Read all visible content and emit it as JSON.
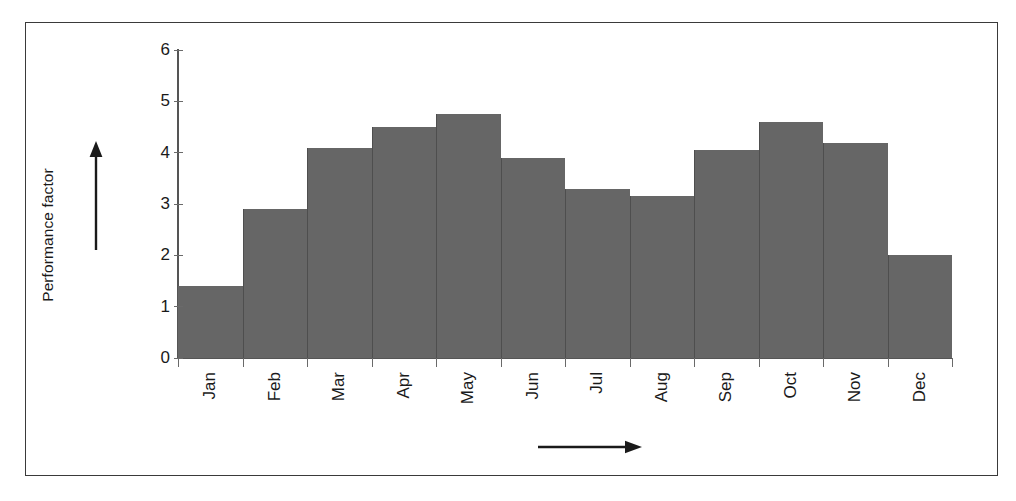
{
  "chart_data": {
    "type": "bar",
    "title": "",
    "subtitle": "",
    "xlabel": "",
    "ylabel": "Performance factor",
    "categories": [
      "Jan",
      "Feb",
      "Mar",
      "Apr",
      "May",
      "Jun",
      "Jul",
      "Aug",
      "Sep",
      "Oct",
      "Nov",
      "Dec"
    ],
    "values": [
      1.4,
      2.9,
      4.1,
      4.5,
      4.75,
      3.9,
      3.3,
      3.15,
      4.05,
      4.6,
      4.18,
      2.0
    ],
    "series": [
      {
        "name": "Performance factor",
        "values": [
          1.4,
          2.9,
          4.1,
          4.5,
          4.75,
          3.9,
          3.3,
          3.15,
          4.05,
          4.6,
          4.18,
          2.0
        ]
      }
    ],
    "ylim": [
      0,
      6
    ],
    "yticks": [
      0,
      1,
      2,
      3,
      4,
      5,
      6
    ],
    "ytick_labels": [
      "0",
      "1",
      "2",
      "3",
      "4",
      "5",
      "6"
    ],
    "grid": false,
    "legend": false,
    "legend_position": "none",
    "bar_color": "#666666",
    "bar_edge_color": "#4e4e4e",
    "axis_color": "#555555",
    "frame_color": "#3a3a3a",
    "background_color": "#ffffff",
    "annotations": [
      {
        "name": "y-axis-direction-arrow",
        "kind": "arrow",
        "direction": "up",
        "text": ""
      },
      {
        "name": "x-axis-direction-arrow",
        "kind": "arrow",
        "direction": "right",
        "text": ""
      }
    ]
  },
  "axes": {
    "y_title": "Performance factor",
    "tick_labels": {
      "y": [
        "6",
        "5",
        "4",
        "3",
        "2",
        "1",
        "0"
      ],
      "x": [
        "Jan",
        "Feb",
        "Mar",
        "Apr",
        "May",
        "Jun",
        "Jul",
        "Aug",
        "Sep",
        "Oct",
        "Nov",
        "Dec"
      ]
    }
  }
}
